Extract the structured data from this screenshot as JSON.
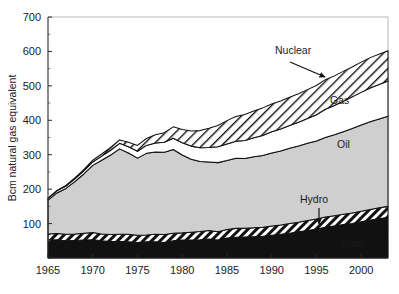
{
  "chart_data": {
    "type": "area",
    "stacked": true,
    "title": "",
    "subtitle": "",
    "xlabel": "",
    "ylabel": "Bcm natural gas equivalent",
    "xlim": [
      1965,
      2003
    ],
    "ylim": [
      0,
      700
    ],
    "ytick_values": [
      0,
      100,
      200,
      300,
      400,
      500,
      600,
      700
    ],
    "ytick_labels": [
      "",
      "100",
      "200",
      "300",
      "400",
      "500",
      "600",
      "700"
    ],
    "yticks_minor_step": 50,
    "xtick_values": [
      1965,
      1970,
      1975,
      1980,
      1985,
      1990,
      1995,
      2000
    ],
    "xtick_labels": [
      "1965",
      "1970",
      "1975",
      "1980",
      "1985",
      "1990",
      "1995",
      "2000"
    ],
    "grid": false,
    "legend_position": "inline-annotations",
    "x": [
      1965,
      1966,
      1967,
      1968,
      1969,
      1970,
      1971,
      1972,
      1973,
      1974,
      1975,
      1976,
      1977,
      1978,
      1979,
      1980,
      1981,
      1982,
      1983,
      1984,
      1985,
      1986,
      1987,
      1988,
      1989,
      1990,
      1991,
      1992,
      1993,
      1994,
      1995,
      1996,
      1997,
      1998,
      1999,
      2000,
      2001,
      2002,
      2003
    ],
    "series": [
      {
        "name": "Coal",
        "fill": "#111111",
        "pattern": "solid-black",
        "values": [
          52,
          53,
          50,
          51,
          52,
          53,
          50,
          48,
          48,
          47,
          45,
          47,
          47,
          45,
          50,
          52,
          52,
          53,
          55,
          52,
          58,
          60,
          61,
          62,
          63,
          66,
          69,
          72,
          76,
          80,
          84,
          89,
          93,
          97,
          100,
          105,
          110,
          114,
          118
        ]
      },
      {
        "name": "Hydro",
        "fill": "#ffffff",
        "pattern": "diagonal-hatch-fine",
        "values": [
          18,
          18,
          19,
          19,
          20,
          21,
          20,
          20,
          21,
          22,
          21,
          20,
          22,
          23,
          22,
          21,
          23,
          24,
          25,
          24,
          25,
          26,
          25,
          26,
          26,
          27,
          27,
          28,
          28,
          29,
          29,
          30,
          30,
          30,
          31,
          31,
          31,
          32,
          32
        ]
      },
      {
        "name": "Oil",
        "fill": "#cfcfcf",
        "pattern": "solid-grey",
        "values": [
          98,
          118,
          133,
          152,
          172,
          195,
          214,
          231,
          248,
          236,
          224,
          237,
          239,
          239,
          243,
          226,
          212,
          203,
          199,
          201,
          200,
          204,
          203,
          206,
          209,
          212,
          215,
          219,
          221,
          224,
          227,
          231,
          235,
          240,
          245,
          250,
          255,
          258,
          262
        ]
      },
      {
        "name": "Gas",
        "fill": "#ffffff",
        "pattern": "solid-white",
        "values": [
          5,
          6,
          7,
          8,
          9,
          10,
          12,
          14,
          16,
          18,
          20,
          23,
          26,
          29,
          33,
          36,
          38,
          40,
          42,
          46,
          48,
          49,
          52,
          55,
          58,
          62,
          64,
          66,
          69,
          72,
          76,
          82,
          85,
          88,
          92,
          95,
          98,
          100,
          102
        ]
      },
      {
        "name": "Nuclear",
        "fill": "#ffffff",
        "pattern": "diagonal-hatch-wide",
        "values": [
          1,
          1,
          2,
          3,
          4,
          5,
          6,
          8,
          10,
          13,
          17,
          20,
          24,
          28,
          33,
          38,
          44,
          50,
          56,
          62,
          68,
          72,
          76,
          78,
          80,
          80,
          81,
          82,
          83,
          84,
          85,
          86,
          86,
          87,
          87,
          88,
          88,
          88,
          88
        ]
      }
    ],
    "annotations": [
      {
        "name": "nuclear-label",
        "text": "Nuclear",
        "x": 275,
        "y": 54,
        "arrow": true,
        "arrow_from": [
          290,
          62
        ],
        "arrow_to": [
          325,
          77
        ]
      },
      {
        "name": "gas-label",
        "text": "Gas",
        "x": 330,
        "y": 104,
        "arrow": false
      },
      {
        "name": "oil-label",
        "text": "Oil",
        "x": 337,
        "y": 148,
        "arrow": false
      },
      {
        "name": "hydro-label",
        "text": "Hydro",
        "x": 300,
        "y": 203,
        "arrow": true,
        "arrow_from": [
          319,
          208
        ],
        "arrow_to": [
          319,
          224
        ]
      },
      {
        "name": "coal-label",
        "text": "Coal",
        "x": 341,
        "y": 247,
        "arrow": false
      }
    ]
  }
}
